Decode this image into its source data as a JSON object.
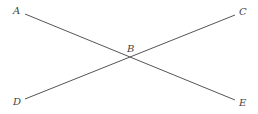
{
  "diagram": {
    "type": "intersecting-lines",
    "points": {
      "A": {
        "label": "A",
        "x": 25,
        "y": 15
      },
      "B": {
        "label": "B",
        "x": 130,
        "y": 57
      },
      "C": {
        "label": "C",
        "x": 235,
        "y": 15
      },
      "D": {
        "label": "D",
        "x": 25,
        "y": 99
      },
      "E": {
        "label": "E",
        "x": 235,
        "y": 100
      }
    },
    "segments": [
      {
        "name": "AE",
        "from": "A",
        "to": "E"
      },
      {
        "name": "DC",
        "from": "D",
        "to": "C"
      }
    ]
  }
}
